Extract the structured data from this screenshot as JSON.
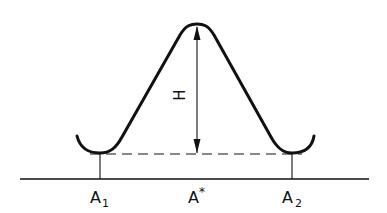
{
  "diagram": {
    "type": "energy-barrier-profile",
    "height_label": "H",
    "positions": [
      {
        "label": "A",
        "sub": "1",
        "sup": ""
      },
      {
        "label": "A",
        "sub": "",
        "sup": "*"
      },
      {
        "label": "A",
        "sub": "2",
        "sup": ""
      }
    ],
    "stroke_color": "#111111",
    "background": "#ffffff"
  }
}
